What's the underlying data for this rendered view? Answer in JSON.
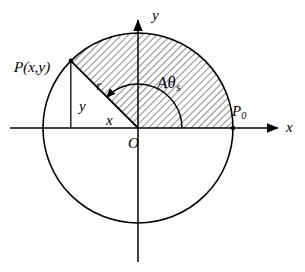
{
  "figure": {
    "type": "geometry-diagram",
    "background_color": "#ffffff",
    "stroke_color": "#000000",
    "hatch_color": "#000000"
  },
  "axes": {
    "x_label": "x",
    "y_label": "y",
    "origin_label": "O",
    "x_axis": {
      "x1": 10,
      "y1": 128,
      "x2": 280,
      "y2": 128,
      "arrow": "right"
    },
    "y_axis": {
      "x1": 138,
      "y1": 262,
      "x2": 138,
      "y2": 18,
      "arrow": "up"
    }
  },
  "circle": {
    "center_x": 138,
    "center_y": 128,
    "radius": 95
  },
  "sector": {
    "start_angle_deg": 0,
    "end_angle_deg": 135,
    "fill": "hatched",
    "hatch_angle_deg": 45,
    "hatch_spacing_px": 5,
    "area_label": "A",
    "angle_symbol": "θ",
    "angle_subscript": "s"
  },
  "points": [
    {
      "id": "P",
      "label": "P",
      "label_args": "(x,y)",
      "x": 71,
      "y": 61,
      "angle_deg": 135
    },
    {
      "id": "P0",
      "label": "P",
      "label_subscript": "0",
      "x": 233,
      "y": 128,
      "angle_deg": 0
    }
  ],
  "segments": {
    "radius_label": "r",
    "x_projection_label": "x",
    "y_projection_label": "y"
  },
  "angle_arc": {
    "radius_px": 44,
    "start_deg": 0,
    "end_deg": 135,
    "arrow_at": "end"
  }
}
